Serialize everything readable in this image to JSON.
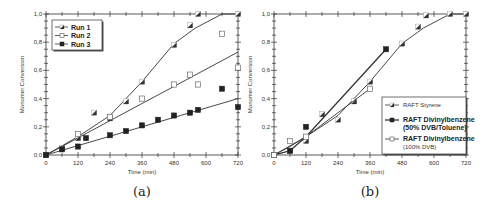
{
  "chart_data": [
    {
      "type": "scatter",
      "panel": "a",
      "caption": "(a)",
      "xlabel": "Time (min)",
      "ylabel": "Monomer Conversion",
      "xlim": [
        0,
        720
      ],
      "ylim": [
        0,
        1.0
      ],
      "xticks": [
        0,
        120,
        240,
        360,
        480,
        600,
        720
      ],
      "yticks": [
        "0,0",
        "0,2",
        "0,4",
        "0,6",
        "0,8",
        "1,0"
      ],
      "legend_position": "upper-left",
      "series": [
        {
          "name": "Run 1",
          "marker": "half-filled-square",
          "points": [
            [
              0,
              0
            ],
            [
              60,
              0.05
            ],
            [
              120,
              0.12
            ],
            [
              180,
              0.3
            ],
            [
              240,
              0.26
            ],
            [
              300,
              0.38
            ],
            [
              360,
              0.52
            ],
            [
              480,
              0.78
            ],
            [
              540,
              0.92
            ],
            [
              570,
              1.0
            ],
            [
              720,
              1.0
            ]
          ],
          "fit": [
            [
              0,
              0
            ],
            [
              120,
              0.13
            ],
            [
              240,
              0.28
            ],
            [
              360,
              0.52
            ],
            [
              480,
              0.79
            ],
            [
              560,
              0.9
            ],
            [
              660,
              1.0
            ],
            [
              720,
              1.0
            ]
          ]
        },
        {
          "name": "Run 2",
          "marker": "open-square",
          "points": [
            [
              0,
              0
            ],
            [
              120,
              0.15
            ],
            [
              240,
              0.27
            ],
            [
              360,
              0.4
            ],
            [
              480,
              0.5
            ],
            [
              540,
              0.57
            ],
            [
              570,
              0.5
            ],
            [
              660,
              0.86
            ],
            [
              720,
              0.62
            ]
          ],
          "fit": [
            [
              0,
              0
            ],
            [
              720,
              0.73
            ]
          ]
        },
        {
          "name": "Run 3",
          "marker": "filled-square",
          "points": [
            [
              0,
              0
            ],
            [
              60,
              0.04
            ],
            [
              120,
              0.06
            ],
            [
              150,
              0.12
            ],
            [
              240,
              0.14
            ],
            [
              300,
              0.17
            ],
            [
              360,
              0.21
            ],
            [
              420,
              0.25
            ],
            [
              480,
              0.28
            ],
            [
              540,
              0.3
            ],
            [
              570,
              0.32
            ],
            [
              660,
              0.47
            ],
            [
              720,
              0.34
            ]
          ],
          "fit": [
            [
              0,
              0
            ],
            [
              720,
              0.4
            ]
          ]
        }
      ]
    },
    {
      "type": "line",
      "panel": "b",
      "caption": "(b)",
      "xlabel": "Time (min)",
      "ylabel": "Monomer Conversion",
      "xlim": [
        0,
        720
      ],
      "ylim": [
        0,
        1.0
      ],
      "xticks": [
        0,
        120,
        240,
        360,
        480,
        600,
        720
      ],
      "yticks": [
        "0,0",
        "0,2",
        "0,4",
        "0,6",
        "0,8",
        "1,0"
      ],
      "legend_position": "lower-right",
      "series": [
        {
          "name": "RAFT Styrene",
          "marker": "half-filled-square",
          "points": [
            [
              0,
              0
            ],
            [
              60,
              0.03
            ],
            [
              120,
              0.1
            ],
            [
              180,
              0.29
            ],
            [
              240,
              0.25
            ],
            [
              300,
              0.38
            ],
            [
              360,
              0.52
            ],
            [
              480,
              0.79
            ],
            [
              540,
              0.91
            ],
            [
              570,
              0.99
            ],
            [
              660,
              1.0
            ],
            [
              720,
              1.0
            ]
          ],
          "fit": [
            [
              0,
              0
            ],
            [
              120,
              0.13
            ],
            [
              240,
              0.28
            ],
            [
              360,
              0.52
            ],
            [
              480,
              0.79
            ],
            [
              560,
              0.9
            ],
            [
              660,
              1.0
            ],
            [
              720,
              1.0
            ]
          ]
        },
        {
          "name": "RAFT Divinylbenzene",
          "name_line2": "(50% DVB/Toluene)",
          "marker": "filled-square",
          "points": [
            [
              0,
              0
            ],
            [
              60,
              0.03
            ],
            [
              120,
              0.2
            ],
            [
              420,
              0.75
            ]
          ],
          "fit": [
            [
              0,
              0
            ],
            [
              60,
              0.03
            ],
            [
              120,
              0.13
            ],
            [
              420,
              0.75
            ]
          ]
        },
        {
          "name": "RAFT Divinylbenzene",
          "name_line2": "(100% DVB)",
          "marker": "open-square",
          "points": [
            [
              0,
              0
            ],
            [
              60,
              0.1
            ],
            [
              120,
              0.13
            ],
            [
              360,
              0.47
            ]
          ],
          "fit": [
            [
              0,
              0
            ],
            [
              60,
              0.06
            ],
            [
              120,
              0.13
            ],
            [
              360,
              0.47
            ]
          ]
        }
      ]
    }
  ]
}
